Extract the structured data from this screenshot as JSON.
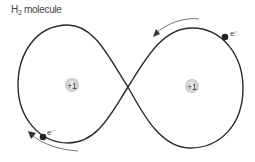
{
  "title": {
    "prefix": "H",
    "subscript": "2",
    "suffix": " molecule"
  },
  "nuclei": [
    {
      "label": "+1",
      "x": 72,
      "y": 85
    },
    {
      "label": "+1",
      "x": 192,
      "y": 86
    }
  ],
  "electrons": [
    {
      "label": "e⁻",
      "x": 225,
      "y": 37
    },
    {
      "label": "e⁻",
      "x": 43,
      "y": 135
    }
  ],
  "colors": {
    "line": "#2a2a2a",
    "arrow": "#555555",
    "nucleus_fill": "#d8d8d8",
    "electron": "#222222"
  }
}
